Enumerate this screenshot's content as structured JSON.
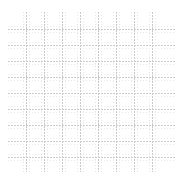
{
  "canvas": {
    "width": 183,
    "height": 178,
    "background_color": "#ffffff"
  },
  "chart_data": {
    "type": "table",
    "title": "",
    "subtitle": "",
    "xlabel": "",
    "ylabel": "",
    "legend": [],
    "annotations": [],
    "tick_labels_x": [],
    "tick_labels_y": [],
    "series": [],
    "values": [],
    "categories": [],
    "grid": true,
    "grid_description": "empty grid / graph-paper pattern with no plotted data, no axis tick labels and no text",
    "grid_major_color": "#c9c9c9",
    "grid_minor_color": "#e7e7e7",
    "grid_line_style": "dotted",
    "vertical_line_count": 8,
    "horizontal_line_count": 9,
    "vertical_line_positions": [
      26,
      44,
      62,
      80,
      98,
      116,
      134,
      152
    ],
    "horizontal_line_positions": [
      29,
      45,
      61,
      77,
      93,
      109,
      125,
      141,
      157
    ],
    "vertical_line_span": [
      12,
      172
    ],
    "horizontal_line_span": [
      8,
      175
    ],
    "vertical_spacing": 18,
    "horizontal_spacing": 16,
    "minor_vertical_offsets": [
      -3,
      3
    ],
    "minor_horizontal_offsets": [
      -3,
      3
    ]
  }
}
